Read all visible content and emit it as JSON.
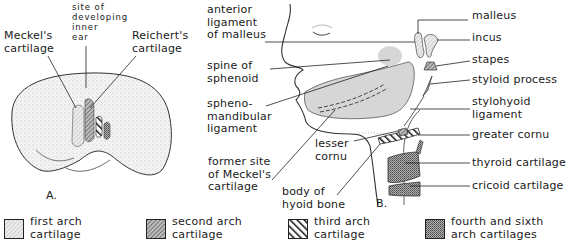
{
  "figure": {
    "panels": [
      {
        "id": "A",
        "caption": "A.",
        "subject": "embryo, lateral view",
        "labels": [
          {
            "key": "meckel",
            "text": "Meckel's\ncartilage"
          },
          {
            "key": "inner_ear",
            "text": "site of\ndeveloping\ninner\near"
          },
          {
            "key": "reichert",
            "text": "Reichert's\ncartilage"
          }
        ]
      },
      {
        "id": "B",
        "caption": "B.",
        "subject": "adult head and neck, lateral view",
        "labels_left": [
          {
            "key": "ant_lig_malleus",
            "text": "anterior\nligament\nof malleus"
          },
          {
            "key": "spine_sphenoid",
            "text": "spine of\nsphenoid"
          },
          {
            "key": "sphenomandibular",
            "text": "spheno-\nmandibular\nligament"
          },
          {
            "key": "former_meckel",
            "text": "former site\nof Meckel's\ncartilage"
          },
          {
            "key": "lesser_cornu",
            "text": "lesser\ncornu"
          },
          {
            "key": "body_hyoid",
            "text": "body of\nhyoid bone"
          }
        ],
        "labels_right": [
          {
            "key": "malleus",
            "text": "malleus"
          },
          {
            "key": "incus",
            "text": "incus"
          },
          {
            "key": "stapes",
            "text": "stapes"
          },
          {
            "key": "styloid",
            "text": "styloid process"
          },
          {
            "key": "stylohyoid",
            "text": "stylohyoid\nligament"
          },
          {
            "key": "greater_cornu",
            "text": "greater cornu"
          },
          {
            "key": "thyroid",
            "text": "thyroid cartilage"
          },
          {
            "key": "cricoid",
            "text": "cricoid cartilage"
          }
        ]
      }
    ],
    "legend": [
      {
        "key": "first",
        "text": "first arch\ncartilage",
        "pattern": "light-fine-hatch",
        "color": "#d6d6d6"
      },
      {
        "key": "second",
        "text": "second arch\ncartilage",
        "pattern": "medium-diagonal-hatch",
        "color": "#8a8a8a"
      },
      {
        "key": "third",
        "text": "third arch\ncartilage",
        "pattern": "heavy-diagonal-stripes",
        "color": "#1a1a1a"
      },
      {
        "key": "fourth_sixth",
        "text": "fourth and sixth\narch cartilages",
        "pattern": "dense-stipple",
        "color": "#9a9a9a"
      }
    ]
  }
}
